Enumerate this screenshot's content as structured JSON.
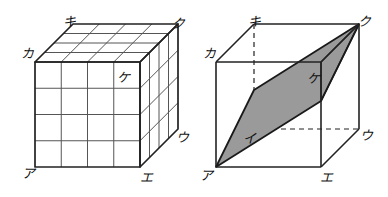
{
  "figure": {
    "panels": [
      {
        "id": "left-panel",
        "name": "subdivided-cube",
        "description": "Cube subdivided into a 4 by 4 by 4 grid of small cubes",
        "grid_divisions": 4,
        "labels": [
          {
            "key": "a",
            "text": "ア",
            "role": "front-bottom-left",
            "x": 22,
            "y": 178
          },
          {
            "key": "e",
            "text": "エ",
            "role": "front-bottom-right",
            "x": 140,
            "y": 182
          },
          {
            "key": "u",
            "text": "ウ",
            "role": "back-bottom-right",
            "x": 176,
            "y": 142
          },
          {
            "key": "ku",
            "text": "ク",
            "role": "back-top-right",
            "x": 172,
            "y": 28
          },
          {
            "key": "ki",
            "text": "キ",
            "role": "back-top-left",
            "x": 63,
            "y": 26
          },
          {
            "key": "ka",
            "text": "カ",
            "role": "front-top-left",
            "x": 21,
            "y": 58
          },
          {
            "key": "ke",
            "text": "ケ",
            "role": "front-face-cell",
            "x": 117,
            "y": 82
          }
        ]
      },
      {
        "id": "right-panel",
        "name": "cube-with-cross-section",
        "description": "Cube with a shaded parallelogram cross-section through vertices A, I, Ku, Ke",
        "section_vertices": [
          "ア",
          "イ",
          "ク",
          "ケ"
        ],
        "labels": [
          {
            "key": "a",
            "text": "ア",
            "role": "front-bottom-left",
            "x": 200,
            "y": 180
          },
          {
            "key": "i",
            "text": "イ",
            "role": "hidden-back-mid",
            "x": 243,
            "y": 143
          },
          {
            "key": "e",
            "text": "エ",
            "role": "front-bottom-right",
            "x": 320,
            "y": 182
          },
          {
            "key": "u",
            "text": "ウ",
            "role": "back-bottom-right",
            "x": 360,
            "y": 140
          },
          {
            "key": "ku",
            "text": "ク",
            "role": "back-top-right",
            "x": 358,
            "y": 26
          },
          {
            "key": "ki",
            "text": "キ",
            "role": "back-top-left",
            "x": 248,
            "y": 26
          },
          {
            "key": "ka",
            "text": "カ",
            "role": "front-top-left",
            "x": 203,
            "y": 58
          },
          {
            "key": "ke",
            "text": "ケ",
            "role": "section-mid-right",
            "x": 307,
            "y": 83
          }
        ]
      }
    ],
    "colors": {
      "stroke": "#222222",
      "grid_stroke": "#555555",
      "section_fill": "#9a9a9a",
      "background": "#ffffff",
      "hidden_line": "#222222"
    }
  }
}
